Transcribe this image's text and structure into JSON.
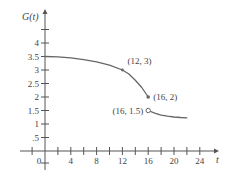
{
  "chart_data": {
    "type": "line",
    "title": "",
    "xlabel": "t",
    "ylabel": "G(t)",
    "xlim": [
      -2,
      26
    ],
    "ylim": [
      -0.7,
      4.7
    ],
    "grid": false,
    "x_ticks": [
      -2,
      2,
      4,
      6,
      8,
      10,
      12,
      14,
      16,
      18,
      20,
      22,
      24
    ],
    "x_tick_labels": [
      "0",
      "4",
      "8",
      "12",
      "16",
      "20",
      "24"
    ],
    "x_tick_label_values": [
      0,
      4,
      8,
      12,
      16,
      20,
      24
    ],
    "y_ticks": [
      0.5,
      1,
      1.5,
      2,
      2.5,
      3,
      3.5,
      4,
      4.5
    ],
    "y_tick_labels": [
      ".5",
      "1",
      "1.5",
      "2",
      "2.5",
      "3",
      "3.5",
      "4"
    ],
    "y_tick_label_values": [
      0.5,
      1,
      1.5,
      2,
      2.5,
      3,
      3.5,
      4
    ],
    "series": [
      {
        "name": "G(t) piece 1",
        "x": [
          0,
          2,
          4,
          6,
          8,
          10,
          12,
          13,
          14,
          15,
          16
        ],
        "y": [
          3.5,
          3.49,
          3.45,
          3.38,
          3.3,
          3.18,
          3.0,
          2.85,
          2.62,
          2.35,
          2.0
        ],
        "end": "closed"
      },
      {
        "name": "G(t) piece 2",
        "x": [
          16,
          17,
          18,
          19,
          20,
          21,
          22
        ],
        "y": [
          1.5,
          1.4,
          1.33,
          1.29,
          1.26,
          1.24,
          1.23
        ],
        "start": "open"
      }
    ],
    "annotations": [
      {
        "label": "(12, 3)",
        "x": 12,
        "y": 3,
        "marker": "dot"
      },
      {
        "label": "(16, 2)",
        "x": 16,
        "y": 2,
        "marker": "filled"
      },
      {
        "label": "(16, 1.5)",
        "x": 16,
        "y": 1.5,
        "marker": "open"
      }
    ]
  },
  "labels": {
    "ylabel": "G(t)",
    "xlabel": "t",
    "ann1": "(12, 3)",
    "ann2": "(16, 2)",
    "ann3": "(16, 1.5)"
  }
}
